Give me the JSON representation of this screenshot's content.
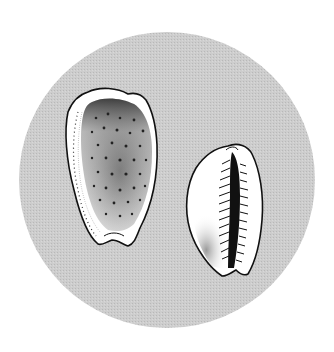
{
  "illustration": {
    "subject": "Two cowrie shells",
    "background_color": "#ffffff",
    "disc_color": "#c9c9c9",
    "outline_color": "#111111",
    "shell_fill": "#ffffff",
    "shells": [
      {
        "view": "dorsal",
        "description": "Spotted cowrie shell, dorsal view, speckled with dark spots"
      },
      {
        "view": "ventral",
        "description": "Cowrie shell, ventral view showing toothed aperture"
      }
    ]
  }
}
